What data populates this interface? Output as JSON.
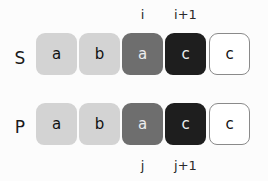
{
  "rows": [
    {
      "label": "S",
      "cells": [
        {
          "char": "a",
          "shade": "light"
        },
        {
          "char": "b",
          "shade": "light"
        },
        {
          "char": "a",
          "shade": "medium"
        },
        {
          "char": "c",
          "shade": "dark"
        },
        {
          "char": "c",
          "shade": "empty"
        }
      ],
      "indices": [
        {
          "label": "i",
          "cell": 2
        },
        {
          "label": "i+1",
          "cell": 3
        }
      ]
    },
    {
      "label": "P",
      "cells": [
        {
          "char": "a",
          "shade": "light"
        },
        {
          "char": "b",
          "shade": "light"
        },
        {
          "char": "a",
          "shade": "medium"
        },
        {
          "char": "c",
          "shade": "dark"
        },
        {
          "char": "c",
          "shade": "empty"
        }
      ],
      "indices": [
        {
          "label": "j",
          "cell": 2
        },
        {
          "label": "j+1",
          "cell": 3
        }
      ]
    }
  ],
  "colors": {
    "light": "#d3d3d3",
    "medium": "#6e6e6e",
    "dark": "#1e1e1e",
    "empty": "#ffffff",
    "outline": "#8a8a8a"
  }
}
